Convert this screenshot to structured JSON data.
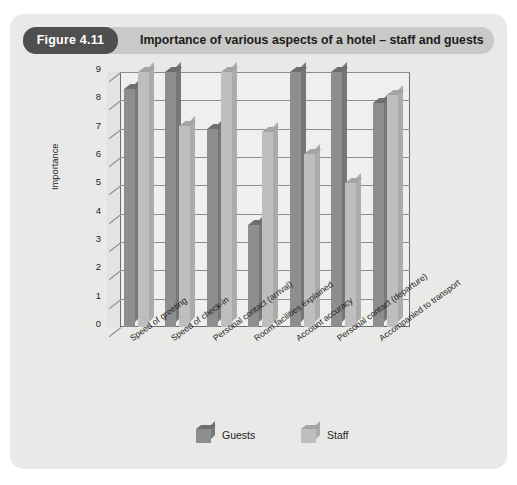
{
  "figure": {
    "number_label": "Figure 4.11",
    "title": "Importance of various aspects of a hotel – staff and guests"
  },
  "colors": {
    "panel_background": "#e9e9e7",
    "titlebar_background": "#c9c9c7",
    "figure_badge_background": "#4f4f52",
    "plot_background": "#efefed",
    "axis_line": "#6d6d6d",
    "gridline": "#8e8e8e",
    "guests_bar": "#8e8e8e",
    "staff_bar": "#bebebe"
  },
  "chart_data": {
    "type": "bar",
    "title": "Importance of various aspects of a hotel – staff and guests",
    "xlabel": "",
    "ylabel": "Importance",
    "ylim": [
      0,
      9
    ],
    "yticks": [
      0,
      1,
      2,
      3,
      4,
      5,
      6,
      7,
      8,
      9
    ],
    "grid": true,
    "legend_position": "bottom",
    "categories": [
      "Speed of greeting",
      "Speed of check-in",
      "Personal contact (arrival)",
      "Room facilities explained",
      "Account accuracy",
      "Personal contact (departure)",
      "Accompanied to transport"
    ],
    "series": [
      {
        "name": "Guests",
        "color": "#8e8e8e",
        "values": [
          8.4,
          9.0,
          7.0,
          3.6,
          9.0,
          9.0,
          7.9
        ]
      },
      {
        "name": "Staff",
        "color": "#bebebe",
        "values": [
          9.0,
          7.1,
          9.0,
          6.9,
          6.1,
          5.1,
          8.2
        ]
      }
    ]
  }
}
